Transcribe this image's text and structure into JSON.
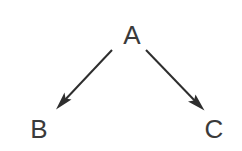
{
  "diagram": {
    "type": "directed-graph",
    "title": "",
    "background_color": "#ffffff",
    "node_color": "#3a3a3a",
    "edge_color": "#2e2e2e",
    "nodes": [
      {
        "id": "A",
        "label": "A",
        "x": 132,
        "y": 44
      },
      {
        "id": "B",
        "label": "B",
        "x": 39,
        "y": 138
      },
      {
        "id": "C",
        "label": "C",
        "x": 214,
        "y": 138
      }
    ],
    "edges": [
      {
        "from": "A",
        "to": "B",
        "label": "",
        "arrowhead": "filled-barbed",
        "x1": 112,
        "y1": 50,
        "x2": 58,
        "y2": 107
      },
      {
        "from": "A",
        "to": "C",
        "label": "",
        "arrowhead": "filled-barbed",
        "x1": 146,
        "y1": 50,
        "x2": 202,
        "y2": 108
      }
    ]
  }
}
